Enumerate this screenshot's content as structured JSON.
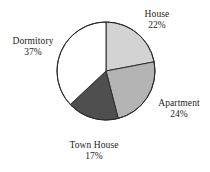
{
  "chart_data": {
    "type": "pie",
    "title": "",
    "subtitle": "",
    "xlabel": "",
    "ylabel": "",
    "legend_position": "none",
    "grid": false,
    "start_angle_deg": 0,
    "direction": "clockwise",
    "categories": [
      "House",
      "Apartment",
      "Town House",
      "Dormitory"
    ],
    "values": [
      22,
      24,
      17,
      37
    ],
    "value_unit": "%",
    "slices": [
      {
        "label": "House",
        "value": 22,
        "value_text": "22%",
        "color": "#d3d3d3"
      },
      {
        "label": "Apartment",
        "value": 24,
        "value_text": "24%",
        "color": "#b4b4b4"
      },
      {
        "label": "Town House",
        "value": 17,
        "value_text": "17%",
        "color": "#4f4f4f"
      },
      {
        "label": "Dormitory",
        "value": 37,
        "value_text": "37%",
        "color": "#ffffff"
      }
    ],
    "outline_color": "#2b2b2b"
  },
  "labels": {
    "house": {
      "name": "House",
      "pct": "22%"
    },
    "apartment": {
      "name": "Apartment",
      "pct": "24%"
    },
    "town_house": {
      "name": "Town House",
      "pct": "17%"
    },
    "dormitory": {
      "name": "Dormitory",
      "pct": "37%"
    }
  }
}
